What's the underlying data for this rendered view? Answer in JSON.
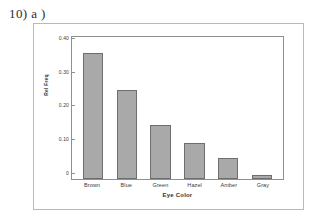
{
  "question_label": "10) a )",
  "chart_data": {
    "type": "bar",
    "title": "",
    "xlabel": "Eye Color",
    "ylabel": "Rel Freq",
    "categories": [
      "Brown",
      "Blue",
      "Green",
      "Hazel",
      "Amber",
      "Gray"
    ],
    "values": [
      0.372,
      0.264,
      0.159,
      0.108,
      0.062,
      0.013
    ],
    "ylim": [
      0,
      0.42
    ],
    "y_ticks": [
      {
        "value": 0.4,
        "label": "0.40"
      },
      {
        "value": 0.3,
        "label": "0.30"
      },
      {
        "value": 0.2,
        "label": "0.20"
      },
      {
        "value": 0.1,
        "label": "0.10"
      },
      {
        "value": 0.0,
        "label": "0"
      }
    ],
    "grid": false,
    "legend": "none",
    "bar_fill": "#a9a9a9",
    "bar_border": "#6e6e6e",
    "axis_color": "#8f8f8f",
    "frame_color": "#b9b9b9",
    "background": "#ffffff"
  }
}
